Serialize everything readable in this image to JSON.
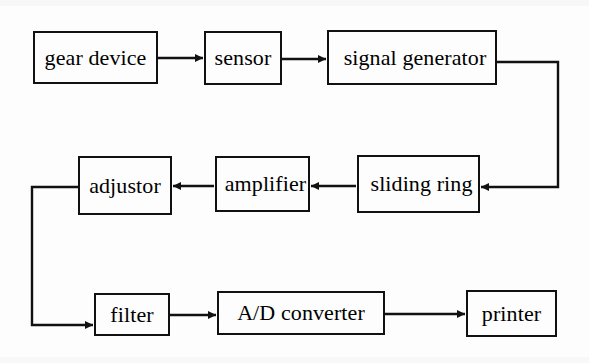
{
  "diagram": {
    "line_color": "#111111",
    "text_color": "#000000",
    "background_color": "#fdfdfd",
    "nodes": [
      {
        "id": "gear_device",
        "label": "gear device",
        "x": 33,
        "y": 31,
        "w": 125,
        "h": 53
      },
      {
        "id": "sensor",
        "label": "sensor",
        "x": 204,
        "y": 31,
        "w": 78,
        "h": 54
      },
      {
        "id": "signal_generator",
        "label": "signal generator",
        "x": 327,
        "y": 30,
        "w": 170,
        "h": 55
      },
      {
        "id": "adjustor",
        "label": "adjustor",
        "x": 78,
        "y": 156,
        "w": 94,
        "h": 59
      },
      {
        "id": "amplifier",
        "label": "amplifier",
        "x": 215,
        "y": 156,
        "w": 95,
        "h": 56
      },
      {
        "id": "sliding_ring",
        "label": "sliding ring",
        "x": 357,
        "y": 155,
        "w": 123,
        "h": 58
      },
      {
        "id": "filter",
        "label": "filter",
        "x": 94,
        "y": 293,
        "w": 76,
        "h": 43
      },
      {
        "id": "ad_converter",
        "label": "A/D converter",
        "x": 217,
        "y": 291,
        "w": 168,
        "h": 44
      },
      {
        "id": "printer",
        "label": "printer",
        "x": 466,
        "y": 290,
        "w": 91,
        "h": 47
      }
    ],
    "connections": [
      {
        "id": "gear-to-sensor",
        "from": "gear_device",
        "to": "sensor",
        "kind": "straight"
      },
      {
        "id": "sensor-to-signal",
        "from": "sensor",
        "to": "signal_generator",
        "kind": "straight"
      },
      {
        "id": "signal-to-sliding",
        "from": "signal_generator",
        "to": "sliding_ring",
        "kind": "right-loop"
      },
      {
        "id": "sliding-to-amplifier",
        "from": "sliding_ring",
        "to": "amplifier",
        "kind": "straight-left"
      },
      {
        "id": "amplifier-to-adjustor",
        "from": "amplifier",
        "to": "adjustor",
        "kind": "straight-left"
      },
      {
        "id": "adjustor-to-filter",
        "from": "adjustor",
        "to": "filter",
        "kind": "left-loop"
      },
      {
        "id": "filter-to-ad-converter",
        "from": "filter",
        "to": "ad_converter",
        "kind": "straight"
      },
      {
        "id": "ad-converter-to-printer",
        "from": "ad_converter",
        "to": "printer",
        "kind": "straight"
      }
    ]
  }
}
